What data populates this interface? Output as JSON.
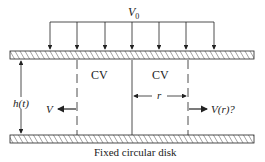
{
  "diagram": {
    "top_label": "V",
    "top_label_sub": "0",
    "cv_left": "CV",
    "cv_right": "CV",
    "height_label": "h(t)",
    "radius_label": "r",
    "velocity_left": "V",
    "velocity_right": "V(r)?",
    "caption": "Fixed circular disk",
    "line_color": "#222222"
  }
}
